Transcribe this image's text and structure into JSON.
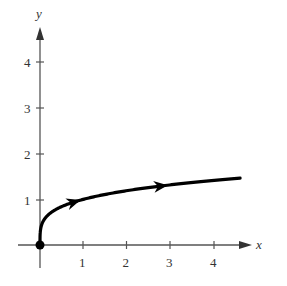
{
  "chart_data": {
    "type": "line",
    "title": "",
    "xlabel": "x",
    "ylabel": "y",
    "x_ticks": [
      1,
      2,
      3,
      4
    ],
    "y_ticks": [
      1,
      2,
      3,
      4
    ],
    "xlim": [
      0,
      4.9
    ],
    "ylim": [
      0,
      4.8
    ],
    "grid": false,
    "legend": null,
    "series": [
      {
        "name": "parametric curve",
        "description": "curve starting at origin (filled point), rising steeply then flattening, with direction arrows pointing right",
        "x": [
          0,
          0.05,
          0.25,
          0.5,
          1,
          1.5,
          2,
          2.5,
          3,
          3.5,
          4,
          4.6
        ],
        "y": [
          0,
          0.47,
          0.71,
          0.84,
          1.0,
          1.11,
          1.19,
          1.26,
          1.32,
          1.37,
          1.41,
          1.46
        ],
        "start_point": [
          0,
          0
        ],
        "direction_arrows_at_x": [
          0.8,
          2.8
        ],
        "color": "#000000"
      }
    ]
  },
  "axes": {
    "x_label": "x",
    "y_label": "y",
    "x_tick_labels": [
      "1",
      "2",
      "3",
      "4"
    ],
    "y_tick_labels": [
      "1",
      "2",
      "3",
      "4"
    ]
  }
}
